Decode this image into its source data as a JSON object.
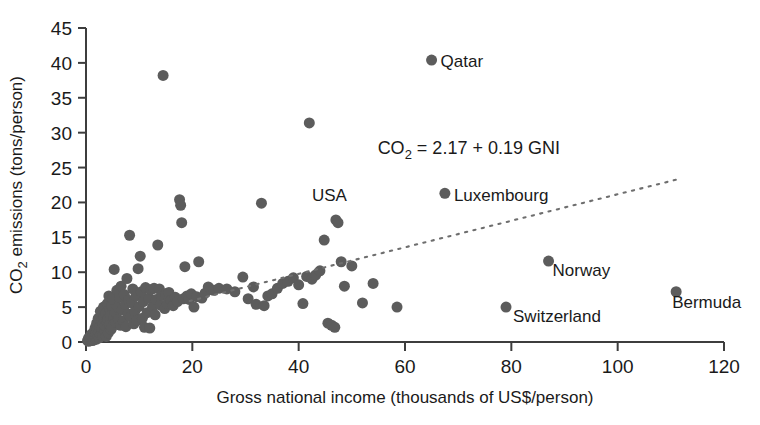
{
  "chart_data": {
    "type": "scatter",
    "title": "",
    "xlabel": "Gross national income (thousands of US$/person)",
    "ylabel_parts": {
      "pre": "CO",
      "sub": "2",
      "post": " emissions (tons/person)"
    },
    "ylabel": "CO2 emissions (tons/person)",
    "xlim": [
      0,
      120
    ],
    "ylim": [
      0,
      45
    ],
    "xticks": [
      0,
      20,
      40,
      60,
      80,
      100,
      120
    ],
    "yticks": [
      0,
      5,
      10,
      15,
      20,
      25,
      30,
      35,
      40,
      45
    ],
    "grid": false,
    "legend": null,
    "marker_color": "#5c5c5c",
    "marker_size_px": 11,
    "annotations": [
      {
        "name": "qatar-label",
        "text": "Qatar",
        "x": 65.0,
        "y": 40.4,
        "dx": 9,
        "dy": 7
      },
      {
        "name": "luxembourg-label",
        "text": "Luxembourg",
        "x": 67.5,
        "y": 21.3,
        "dx": 9,
        "dy": 8
      },
      {
        "name": "usa-label",
        "text": "USA",
        "x": 42.5,
        "y": 20.2,
        "dx": 0,
        "dy": 0
      },
      {
        "name": "norway-label",
        "text": "Norway",
        "x": 87.0,
        "y": 11.6,
        "dx": 4,
        "dy": 15
      },
      {
        "name": "switzerland-label",
        "text": "Switzerland",
        "x": 79.0,
        "y": 5.0,
        "dx": 7,
        "dy": 15
      },
      {
        "name": "bermuda-label",
        "text": "Bermuda",
        "x": 111.0,
        "y": 7.2,
        "dx": -4,
        "dy": 16
      }
    ],
    "regression": {
      "equation_text": "CO2 = 2.17 + 0.19 GNI",
      "equation_parts": {
        "pre": "CO",
        "sub": "2",
        "post": " = 2.17 + 0.19 GNI"
      },
      "intercept": 2.17,
      "slope": 0.19,
      "x_start": 19.5,
      "x_end": 112.0,
      "label_x": 72.0,
      "label_y": 27.0,
      "style": "dotted"
    },
    "points": [
      [
        0.3,
        0.2
      ],
      [
        0.4,
        0.3
      ],
      [
        0.5,
        0.1
      ],
      [
        0.5,
        0.6
      ],
      [
        0.6,
        0.2
      ],
      [
        0.7,
        0.4
      ],
      [
        0.8,
        0.2
      ],
      [
        0.9,
        0.7
      ],
      [
        1.0,
        0.3
      ],
      [
        1.0,
        1.1
      ],
      [
        1.1,
        0.5
      ],
      [
        1.2,
        0.2
      ],
      [
        1.3,
        0.9
      ],
      [
        1.4,
        0.4
      ],
      [
        1.5,
        1.5
      ],
      [
        1.5,
        0.3
      ],
      [
        1.6,
        0.7
      ],
      [
        1.7,
        2.0
      ],
      [
        1.8,
        0.5
      ],
      [
        1.9,
        1.2
      ],
      [
        2.0,
        0.4
      ],
      [
        2.0,
        2.7
      ],
      [
        2.1,
        1.8
      ],
      [
        2.2,
        0.8
      ],
      [
        2.3,
        3.4
      ],
      [
        2.4,
        1.4
      ],
      [
        2.5,
        0.6
      ],
      [
        2.6,
        2.2
      ],
      [
        2.7,
        4.4
      ],
      [
        2.8,
        1.0
      ],
      [
        2.9,
        3.0
      ],
      [
        3.0,
        1.9
      ],
      [
        3.1,
        0.9
      ],
      [
        3.2,
        2.6
      ],
      [
        3.3,
        5.0
      ],
      [
        3.4,
        3.6
      ],
      [
        3.5,
        1.6
      ],
      [
        3.6,
        2.3
      ],
      [
        3.7,
        4.1
      ],
      [
        3.8,
        0.8
      ],
      [
        3.9,
        2.9
      ],
      [
        4.0,
        5.5
      ],
      [
        4.1,
        3.3
      ],
      [
        4.2,
        1.3
      ],
      [
        4.3,
        6.6
      ],
      [
        4.4,
        2.5
      ],
      [
        4.5,
        4.7
      ],
      [
        4.6,
        3.8
      ],
      [
        4.7,
        1.8
      ],
      [
        4.8,
        5.2
      ],
      [
        4.9,
        2.1
      ],
      [
        5.0,
        6.2
      ],
      [
        5.2,
        3.5
      ],
      [
        5.3,
        10.4
      ],
      [
        5.5,
        4.3
      ],
      [
        5.6,
        2.8
      ],
      [
        5.8,
        7.4
      ],
      [
        6.0,
        5.0
      ],
      [
        6.1,
        3.2
      ],
      [
        6.3,
        6.4
      ],
      [
        6.5,
        2.4
      ],
      [
        6.6,
        8.0
      ],
      [
        6.8,
        4.6
      ],
      [
        7.0,
        3.0
      ],
      [
        7.2,
        6.8
      ],
      [
        7.4,
        5.4
      ],
      [
        7.5,
        2.2
      ],
      [
        7.7,
        9.1
      ],
      [
        7.9,
        4.0
      ],
      [
        8.0,
        6.0
      ],
      [
        8.2,
        15.3
      ],
      [
        8.4,
        3.6
      ],
      [
        8.6,
        5.6
      ],
      [
        8.8,
        7.6
      ],
      [
        9.0,
        2.6
      ],
      [
        9.2,
        4.4
      ],
      [
        9.4,
        6.6
      ],
      [
        9.6,
        3.1
      ],
      [
        9.8,
        10.5
      ],
      [
        10.0,
        5.1
      ],
      [
        10.2,
        12.3
      ],
      [
        10.4,
        7.2
      ],
      [
        10.6,
        3.4
      ],
      [
        10.8,
        5.8
      ],
      [
        11.0,
        2.1
      ],
      [
        11.2,
        7.8
      ],
      [
        11.5,
        4.2
      ],
      [
        11.8,
        6.3
      ],
      [
        12.0,
        2.0
      ],
      [
        12.2,
        7.5
      ],
      [
        12.5,
        5.0
      ],
      [
        12.8,
        7.7
      ],
      [
        13.0,
        3.9
      ],
      [
        13.2,
        6.1
      ],
      [
        13.5,
        13.9
      ],
      [
        13.8,
        7.6
      ],
      [
        14.0,
        5.3
      ],
      [
        14.2,
        6.7
      ],
      [
        14.5,
        38.2
      ],
      [
        14.8,
        4.8
      ],
      [
        15.0,
        6.9
      ],
      [
        15.3,
        5.5
      ],
      [
        15.6,
        7.1
      ],
      [
        16.0,
        6.0
      ],
      [
        16.4,
        5.2
      ],
      [
        16.8,
        6.4
      ],
      [
        17.2,
        5.8
      ],
      [
        17.6,
        20.4
      ],
      [
        17.8,
        19.6
      ],
      [
        18.0,
        17.1
      ],
      [
        18.3,
        6.2
      ],
      [
        18.6,
        10.8
      ],
      [
        19.0,
        6.6
      ],
      [
        19.4,
        6.1
      ],
      [
        19.8,
        6.9
      ],
      [
        20.3,
        5.0
      ],
      [
        20.8,
        6.5
      ],
      [
        21.2,
        11.5
      ],
      [
        21.8,
        6.3
      ],
      [
        22.4,
        7.0
      ],
      [
        23.0,
        7.9
      ],
      [
        24.0,
        7.4
      ],
      [
        25.0,
        7.7
      ],
      [
        26.5,
        7.6
      ],
      [
        28.0,
        7.2
      ],
      [
        29.5,
        9.3
      ],
      [
        30.5,
        6.2
      ],
      [
        31.5,
        7.9
      ],
      [
        32.0,
        5.4
      ],
      [
        33.0,
        19.9
      ],
      [
        33.5,
        5.2
      ],
      [
        34.2,
        6.6
      ],
      [
        35.0,
        6.9
      ],
      [
        36.0,
        7.7
      ],
      [
        37.0,
        8.4
      ],
      [
        38.0,
        8.7
      ],
      [
        39.0,
        9.2
      ],
      [
        40.0,
        8.2
      ],
      [
        40.8,
        5.5
      ],
      [
        41.5,
        9.4
      ],
      [
        42.5,
        9.0
      ],
      [
        43.2,
        9.6
      ],
      [
        44.0,
        10.2
      ],
      [
        44.8,
        14.6
      ],
      [
        45.5,
        2.7
      ],
      [
        46.2,
        2.4
      ],
      [
        46.8,
        2.1
      ],
      [
        47.0,
        17.5
      ],
      [
        47.4,
        17.1
      ],
      [
        48.0,
        11.5
      ],
      [
        48.6,
        8.0
      ],
      [
        50.0,
        10.9
      ],
      [
        52.0,
        5.6
      ],
      [
        54.0,
        8.4
      ],
      [
        58.5,
        5.0
      ],
      [
        65.0,
        40.4
      ],
      [
        67.5,
        21.3
      ],
      [
        79.0,
        5.0
      ],
      [
        87.0,
        11.6
      ],
      [
        111.0,
        7.2
      ],
      [
        42.0,
        31.4
      ]
    ]
  }
}
